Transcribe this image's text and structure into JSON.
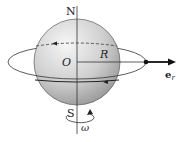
{
  "diagram": {
    "labels": {
      "north": "N",
      "south": "S",
      "center": "O",
      "radius": "R",
      "unit_vector": "e",
      "unit_vector_sub": "r",
      "angular_velocity": "ω"
    },
    "colors": {
      "stroke": "#222222",
      "sphere_light": "#f2f2f2",
      "sphere_dark": "#9a9a9a",
      "background": "#ffffff"
    }
  }
}
